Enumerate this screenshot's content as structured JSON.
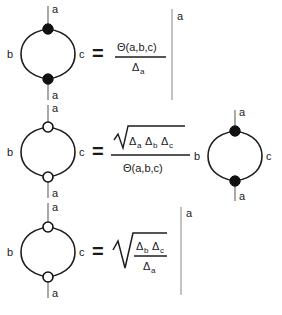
{
  "document": {
    "title": "Bubble diagram identities",
    "description": "Three graphical identities relating theta-graph (bubble) spin network diagrams to algebraic expressions involving Theta(a,b,c) and Delta symbols."
  },
  "symbols": {
    "theta": "Θ",
    "delta": "Δ",
    "equals": "=",
    "radical": "√",
    "label_a": "a",
    "label_b": "b",
    "label_c": "c"
  },
  "colors": {
    "background": "#ffffff",
    "ink": "#1d1d1d",
    "leg_gray": "#6f6f6f",
    "vertical_line": "#9a9a9a",
    "node_fill_filled": "#111111",
    "node_fill_open": "#ffffff"
  },
  "equations": [
    {
      "id": "identity-1",
      "lhs": {
        "type": "bubble-diagram",
        "node_style": "filled",
        "top_leg_label": "a",
        "bottom_leg_label": "a",
        "left_arc_label": "b",
        "right_arc_label": "c"
      },
      "relation": "=",
      "rhs": {
        "type": "fraction-times-line",
        "numerator": "Θ(a,b,c)",
        "numerator_text": "Θ(a,b,c)",
        "denominator_symbol": "Δ",
        "denominator_subscript": "a",
        "factor": {
          "type": "vertical-line",
          "label": "a"
        }
      }
    },
    {
      "id": "identity-2",
      "lhs": {
        "type": "bubble-diagram",
        "node_style": "open",
        "top_leg_label": "a",
        "bottom_leg_label": "a",
        "left_arc_label": "b",
        "right_arc_label": "c"
      },
      "relation": "=",
      "rhs": {
        "type": "fraction-times-diagram",
        "numerator_radical": true,
        "numerator_terms": [
          {
            "symbol": "Δ",
            "subscript": "a"
          },
          {
            "symbol": "Δ",
            "subscript": "b"
          },
          {
            "symbol": "Δ",
            "subscript": "c"
          }
        ],
        "denominator_text": "Θ(a,b,c)",
        "factor": {
          "type": "bubble-diagram",
          "node_style": "filled",
          "top_leg_label": "a",
          "bottom_leg_label": "a",
          "left_arc_label": "b",
          "right_arc_label": "c"
        }
      }
    },
    {
      "id": "identity-3",
      "lhs": {
        "type": "bubble-diagram",
        "node_style": "open",
        "top_leg_label": "a",
        "bottom_leg_label": "a",
        "left_arc_label": "b",
        "right_arc_label": "c"
      },
      "relation": "=",
      "rhs": {
        "type": "radical-fraction-times-line",
        "radical": true,
        "numerator_terms": [
          {
            "symbol": "Δ",
            "subscript": "b"
          },
          {
            "symbol": "Δ",
            "subscript": "c"
          }
        ],
        "denominator_symbol": "Δ",
        "denominator_subscript": "a",
        "factor": {
          "type": "vertical-line",
          "label": "a"
        }
      }
    }
  ]
}
